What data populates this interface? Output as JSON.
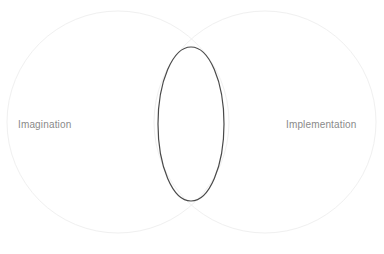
{
  "diagram": {
    "type": "venn-diagram",
    "canvas": {
      "width": 384,
      "height": 254,
      "background_color": "#ffffff"
    },
    "sets": [
      {
        "id": "left",
        "label": "Imagination",
        "label_color": "#8a8a8a",
        "shape": "circle",
        "center_x": 118,
        "center_y": 122,
        "radius": 111,
        "stroke_color": "#f0f0f0",
        "stroke_width": 1,
        "fill": "none"
      },
      {
        "id": "right",
        "label": "Implementation",
        "label_color": "#8a8a8a",
        "shape": "circle",
        "center_x": 265,
        "center_y": 122,
        "radius": 111,
        "stroke_color": "#f0f0f0",
        "stroke_width": 1,
        "fill": "none"
      }
    ],
    "intersection": {
      "id": "overlap",
      "label": "",
      "shape": "ellipse",
      "center_x": 191,
      "center_y": 124,
      "radius_x": 33,
      "radius_y": 77,
      "stroke_color": "#4a4a4a",
      "stroke_width": 1.2,
      "fill": "none"
    }
  }
}
